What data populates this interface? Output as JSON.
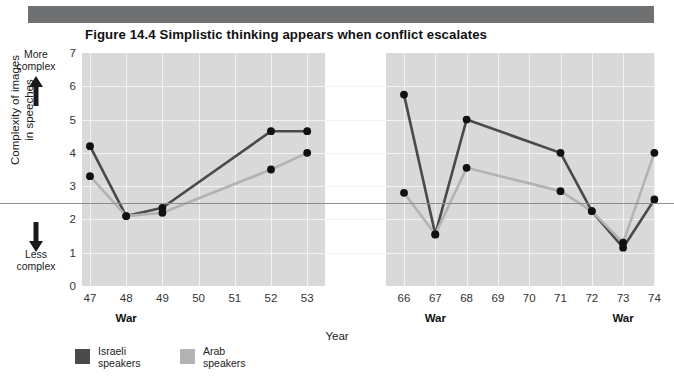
{
  "title": "Figure 14.4  Simplistic thinking appears when conflict escalates",
  "axis": {
    "y_title": "Complexity of images\nin speeches",
    "y_top_label": "More\ncomplex",
    "y_bottom_label": "Less\ncomplex",
    "y_ticks": [
      "7",
      "6",
      "5",
      "4",
      "3",
      "2",
      "1",
      "0"
    ],
    "x_title": "Year",
    "x_ticks_left": [
      "47",
      "48",
      "49",
      "50",
      "51",
      "52",
      "53"
    ],
    "x_ticks_right": [
      "66",
      "67",
      "68",
      "69",
      "70",
      "71",
      "72",
      "73",
      "74"
    ],
    "war_markers": [
      "War",
      "War",
      "War"
    ]
  },
  "legend": [
    {
      "label": "Israeli\nspeakers",
      "color": "#4a4a4a"
    },
    {
      "label": "Arab\nspeakers",
      "color": "#b3b3b3"
    }
  ],
  "colors": {
    "israeli": "#4a4a4a",
    "arab": "#b3b3b3",
    "panel": "#d9d9d9",
    "grid": "#f2f2f2",
    "midline": "#8d8d8d",
    "topbar": "#6f7072"
  },
  "chart_data": {
    "type": "line",
    "title": "Figure 14.4  Simplistic thinking appears when conflict escalates",
    "xlabel": "Year",
    "ylabel": "Complexity of images in speeches",
    "ylim": [
      0,
      7
    ],
    "grid": true,
    "legend_position": "bottom-left",
    "annotations": [
      {
        "text": "War",
        "x": 48
      },
      {
        "text": "War",
        "x": 67
      },
      {
        "text": "War",
        "x": 73
      },
      {
        "text": "More complex",
        "axis": "y",
        "position": "top"
      },
      {
        "text": "Less complex",
        "axis": "y",
        "position": "bottom"
      }
    ],
    "panels": [
      {
        "name": "1947-1953",
        "x": [
          47,
          48,
          49,
          50,
          51,
          52,
          53
        ],
        "series": [
          {
            "name": "Israeli speakers",
            "color": "#4a4a4a",
            "x": [
              47,
              48,
              49,
              52,
              53
            ],
            "values": [
              4.2,
              2.1,
              2.35,
              4.65,
              4.65
            ]
          },
          {
            "name": "Arab speakers",
            "color": "#b3b3b3",
            "x": [
              47,
              48,
              49,
              52,
              53
            ],
            "values": [
              3.3,
              2.1,
              2.2,
              3.5,
              4.0
            ]
          }
        ]
      },
      {
        "name": "1966-1974",
        "x": [
          66,
          67,
          68,
          69,
          70,
          71,
          72,
          73,
          74
        ],
        "series": [
          {
            "name": "Israeli speakers",
            "color": "#4a4a4a",
            "x": [
              66,
              67,
              68,
              71,
              72,
              73,
              74
            ],
            "values": [
              5.75,
              1.55,
              5.0,
              4.0,
              2.25,
              1.15,
              2.6
            ]
          },
          {
            "name": "Arab speakers",
            "color": "#b3b3b3",
            "x": [
              66,
              67,
              68,
              71,
              72,
              73,
              74
            ],
            "values": [
              2.8,
              1.55,
              3.55,
              2.85,
              2.25,
              1.3,
              4.0
            ]
          }
        ]
      }
    ]
  }
}
